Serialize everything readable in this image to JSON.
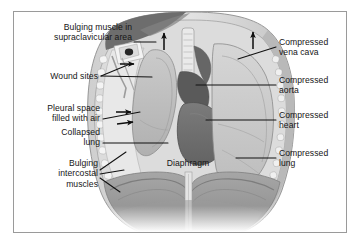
{
  "figure": {
    "type": "medical-illustration",
    "orientation": "coronal",
    "palette": {
      "frame_border": "#9a9a9a",
      "page_background": "#ffffff",
      "skin_light": "#d8d8d8",
      "muscle_mid": "#a8a8a8",
      "muscle_dark": "#6f6f6f",
      "lung_light": "#cfcfcf",
      "lung_shadow": "#b4b4b4",
      "mediastinum_dark": "#5e5e5e",
      "heart_dark": "#707070",
      "diaphragm_mid": "#9c9c9c",
      "rib_white": "#f2f2f2",
      "leader_line": "#111111",
      "text": "#161616"
    }
  },
  "labels": {
    "left": [
      {
        "id": "bulging-muscle",
        "lines": [
          "Bulging muscle in",
          "supraclavicular area"
        ],
        "text": "Bulging muscle in supraclavicular area",
        "x": 18,
        "y": 22,
        "width": 114,
        "align": "right",
        "leader": [
          [
            134,
            42
          ],
          [
            156,
            42
          ]
        ]
      },
      {
        "id": "wound-sites",
        "lines": [
          "Wound sites"
        ],
        "text": "Wound sites",
        "x": 34,
        "y": 71,
        "width": 64,
        "align": "right",
        "leader": [
          [
            101,
            76
          ],
          [
            130,
            64
          ]
        ]
      },
      {
        "id": "pleural-space",
        "lines": [
          "Pleural space",
          "filled with air"
        ],
        "text": "Pleural space filled with air",
        "x": 22,
        "y": 103,
        "width": 78,
        "align": "right",
        "leader": [
          [
            103,
            119
          ],
          [
            140,
            112
          ]
        ]
      },
      {
        "id": "collapsed-lung",
        "lines": [
          "Collapsed",
          "lung"
        ],
        "text": "Collapsed lung",
        "x": 32,
        "y": 127,
        "width": 68,
        "align": "right",
        "leader": [
          [
            103,
            143
          ],
          [
            168,
            143
          ]
        ]
      },
      {
        "id": "bulging-intercostal",
        "lines": [
          "Bulging",
          "intercostal",
          "muscles"
        ],
        "text": "Bulging intercostal muscles",
        "x": 24,
        "y": 158,
        "width": 74,
        "align": "right",
        "leader": [
          [
            100,
            174
          ],
          [
            124,
            153
          ]
        ]
      }
    ],
    "right": [
      {
        "id": "compressed-vena-cava",
        "lines": [
          "Compressed",
          "vena cava"
        ],
        "text": "Compressed vena cava",
        "x": 279,
        "y": 37,
        "width": 70,
        "align": "left",
        "leader": [
          [
            276,
            47
          ],
          [
            238,
            59
          ]
        ]
      },
      {
        "id": "compressed-aorta",
        "lines": [
          "Compressed",
          "aorta"
        ],
        "text": "Compressed aorta",
        "x": 279,
        "y": 75,
        "width": 70,
        "align": "left",
        "leader": [
          [
            276,
            85
          ],
          [
            196,
            85
          ]
        ]
      },
      {
        "id": "compressed-heart",
        "lines": [
          "Compressed",
          "heart"
        ],
        "text": "Compressed heart",
        "x": 279,
        "y": 110,
        "width": 70,
        "align": "left",
        "leader": [
          [
            276,
            120
          ],
          [
            206,
            120
          ]
        ]
      },
      {
        "id": "compressed-lung",
        "lines": [
          "Compressed",
          "lung"
        ],
        "text": "Compressed lung",
        "x": 279,
        "y": 148,
        "width": 70,
        "align": "left",
        "leader": [
          [
            276,
            158
          ],
          [
            236,
            158
          ]
        ]
      }
    ],
    "inline": [
      {
        "id": "diaphragm",
        "lines": [
          "Diaphragm"
        ],
        "text": "Diaphragm",
        "x": 161,
        "y": 158,
        "width": 54,
        "align": "center"
      }
    ]
  },
  "arrows": {
    "description": "Black solid arrowheads indicating direction of air pressure and mediastinal shift",
    "items": [
      {
        "id": "arrow-mediastinal-shift-up",
        "direction": "up",
        "x": 164,
        "y": 40
      },
      {
        "id": "arrow-air-into-pleura-1",
        "direction": "right",
        "x": 132,
        "y": 64
      },
      {
        "id": "arrow-air-into-pleura-2",
        "direction": "right",
        "x": 129,
        "y": 112
      },
      {
        "id": "arrow-air-into-pleura-3",
        "direction": "right",
        "x": 131,
        "y": 122
      },
      {
        "id": "arrow-chest-wall-bulge",
        "direction": "up",
        "x": 253,
        "y": 39
      }
    ]
  }
}
